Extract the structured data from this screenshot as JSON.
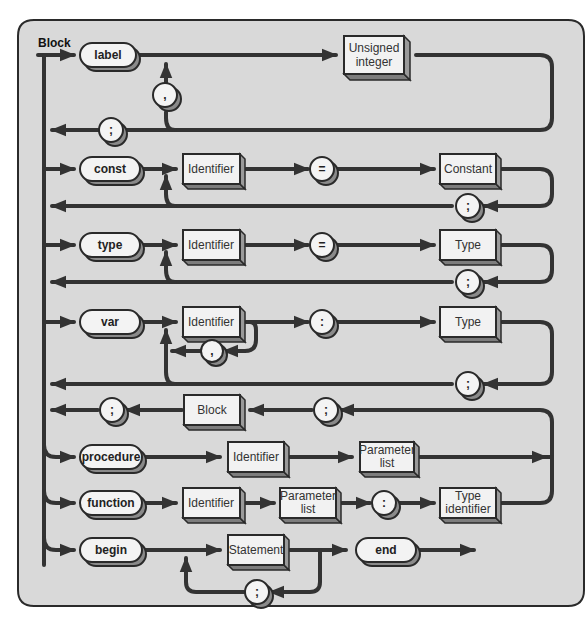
{
  "diagram": {
    "title": "Block",
    "caption": "Figure — Block",
    "colors": {
      "panel_background": "#d9d9d9",
      "lines": "#333333",
      "node_face": "#f2f2f2",
      "node_shadow": "#8a8a8a"
    },
    "rows": [
      {
        "name": "label-row",
        "keyword": "label",
        "nodes": [
          "Unsigned integer"
        ],
        "separator": ",",
        "terminator": ";"
      },
      {
        "name": "const-row",
        "keyword": "const",
        "nodes": [
          "Identifier",
          "=",
          "Constant"
        ],
        "terminator": ";"
      },
      {
        "name": "type-row",
        "keyword": "type",
        "nodes": [
          "Identifier",
          "=",
          "Type"
        ],
        "terminator": ";"
      },
      {
        "name": "var-row",
        "keyword": "var",
        "nodes": [
          "Identifier",
          ":",
          "Type"
        ],
        "separator": ",",
        "terminator": ";"
      },
      {
        "name": "block-return-row",
        "nodes": [
          ";",
          "Block",
          ";"
        ]
      },
      {
        "name": "procedure-row",
        "keyword": "procedure",
        "nodes": [
          "Identifier",
          "Parameter list"
        ]
      },
      {
        "name": "function-row",
        "keyword": "function",
        "nodes": [
          "Identifier",
          "Parameter list",
          ":",
          "Type identifier"
        ]
      },
      {
        "name": "begin-row",
        "keyword": "begin",
        "nodes": [
          "Statement",
          "end"
        ],
        "separator": ";"
      }
    ],
    "labels": {
      "label_kw": "label",
      "unsigned_1": "Unsigned",
      "unsigned_2": "integer",
      "comma": ",",
      "semicolon": ";",
      "const_kw": "const",
      "identifier": "Identifier",
      "equals": "=",
      "constant": "Constant",
      "type_kw": "type",
      "type": "Type",
      "var_kw": "var",
      "colon": ":",
      "block": "Block",
      "procedure_kw": "procedure",
      "param_1": "Parameter",
      "param_2": "list",
      "function_kw": "function",
      "typeid_1": "Type",
      "typeid_2": "identifier",
      "begin_kw": "begin",
      "statement": "Statement",
      "end_kw": "end"
    }
  }
}
